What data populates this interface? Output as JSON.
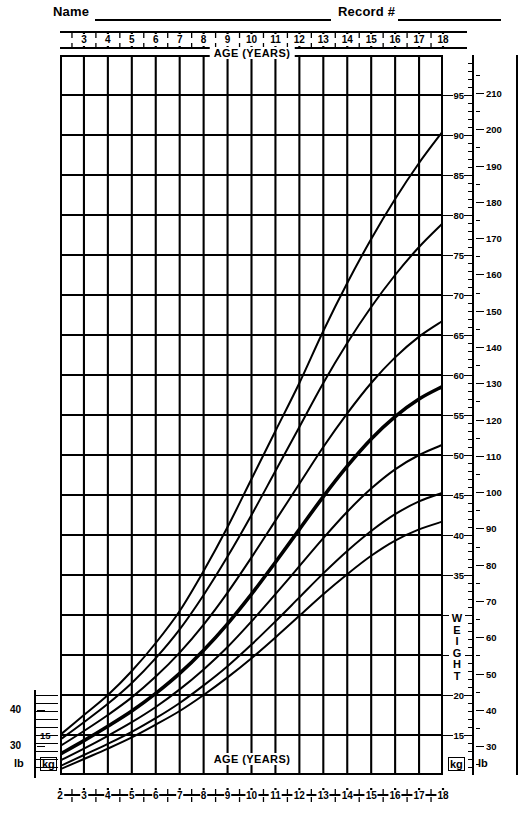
{
  "header": {
    "name_label": "Name",
    "record_label": "Record #"
  },
  "axis": {
    "age_label_top": "AGE (YEARS)",
    "age_label_bottom": "AGE (YEARS)",
    "weight_label": "WEIGHT",
    "unit_kg": "kg",
    "unit_lb": "lb",
    "top_ticks": [
      3,
      4,
      5,
      6,
      7,
      8,
      9,
      10,
      11,
      12,
      13,
      14,
      15,
      16,
      17,
      18
    ],
    "bottom_ticks": [
      2,
      3,
      4,
      5,
      6,
      7,
      8,
      9,
      10,
      11,
      12,
      13,
      14,
      15,
      16,
      17,
      18
    ],
    "right_kg_ticks": [
      15,
      20,
      25,
      30,
      35,
      40,
      45,
      50,
      55,
      60,
      65,
      70,
      75,
      80,
      85,
      90,
      95
    ],
    "right_lb_ticks": [
      30,
      40,
      50,
      60,
      70,
      80,
      90,
      100,
      110,
      120,
      130,
      140,
      150,
      160,
      170,
      180,
      190,
      200,
      210
    ],
    "left_lb_ticks": [
      30,
      40
    ],
    "left_kg_ticks": [
      15
    ]
  },
  "chart_data": {
    "type": "line",
    "title": "",
    "xlabel": "AGE (YEARS)",
    "ylabel": "WEIGHT",
    "xlim": [
      2,
      18
    ],
    "ylim_kg": [
      10,
      100
    ],
    "ylim_lb": [
      22,
      220
    ],
    "grid": true,
    "legend": "none",
    "x": [
      2,
      3,
      4,
      5,
      6,
      7,
      8,
      9,
      10,
      11,
      12,
      13,
      14,
      15,
      16,
      17,
      18
    ],
    "series": [
      {
        "name": "95th percentile",
        "label": "95",
        "values": [
          15.0,
          17.5,
          20.0,
          23.0,
          26.5,
          30.5,
          35.5,
          41.0,
          47.0,
          53.0,
          59.0,
          65.5,
          71.5,
          77.0,
          82.0,
          86.5,
          90.5
        ]
      },
      {
        "name": "90th percentile",
        "label": "90",
        "values": [
          14.4,
          16.6,
          18.9,
          21.5,
          24.6,
          28.2,
          32.5,
          37.3,
          42.5,
          48.0,
          53.5,
          59.0,
          64.0,
          68.5,
          72.5,
          76.0,
          79.0
        ]
      },
      {
        "name": "75th percentile",
        "label": "75",
        "values": [
          13.6,
          15.5,
          17.5,
          19.7,
          22.3,
          25.3,
          28.8,
          32.8,
          37.2,
          41.8,
          46.4,
          51.0,
          55.2,
          59.0,
          62.2,
          64.8,
          66.8
        ]
      },
      {
        "name": "50th percentile",
        "label": "50",
        "values": [
          12.6,
          14.3,
          16.1,
          18.0,
          20.2,
          22.7,
          25.6,
          28.9,
          32.6,
          36.6,
          40.7,
          44.8,
          48.6,
          52.0,
          54.8,
          57.0,
          58.6
        ]
      },
      {
        "name": "25th percentile",
        "label": "25",
        "values": [
          11.8,
          13.3,
          14.9,
          16.6,
          18.5,
          20.7,
          23.2,
          26.0,
          29.2,
          32.6,
          36.1,
          39.6,
          42.9,
          45.8,
          48.2,
          50.0,
          51.3
        ]
      },
      {
        "name": "10th percentile",
        "label": "10",
        "values": [
          11.1,
          12.5,
          13.9,
          15.4,
          17.1,
          19.0,
          21.2,
          23.6,
          26.3,
          29.2,
          32.2,
          35.2,
          38.0,
          40.5,
          42.6,
          44.2,
          45.3
        ]
      },
      {
        "name": "5th percentile",
        "label": "5",
        "values": [
          10.7,
          12.0,
          13.3,
          14.7,
          16.3,
          18.0,
          20.0,
          22.2,
          24.6,
          27.2,
          29.9,
          32.6,
          35.1,
          37.4,
          39.3,
          40.7,
          41.7
        ]
      }
    ]
  },
  "colors": {
    "ink": "#000000",
    "paper": "#ffffff"
  }
}
